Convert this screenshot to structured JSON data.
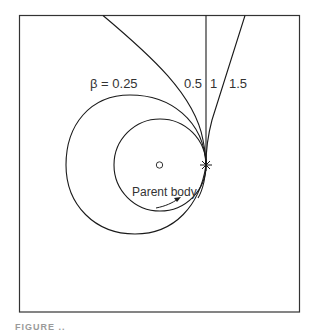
{
  "figure": {
    "labels": {
      "beta_025": "β = 0.25",
      "beta_05": "0.5",
      "beta_1": "1",
      "beta_15": "1.5",
      "parent_body": "Parent body"
    },
    "caption_partial": "FIGURE ..",
    "colors": {
      "stroke": "#1a1a1a",
      "text": "#333333",
      "background": "#ffffff"
    }
  }
}
